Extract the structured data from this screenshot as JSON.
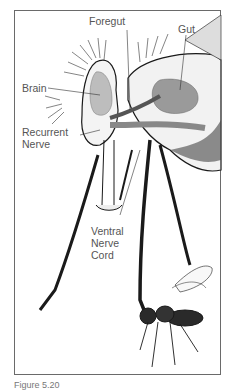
{
  "figure": {
    "labels": {
      "foregut": "Foregut",
      "gut": "Gut",
      "brain": "Brain",
      "recurrent_nerve_1": "Recurrent",
      "recurrent_nerve_2": "Nerve",
      "ventral_1": "Ventral",
      "ventral_2": "Nerve",
      "ventral_3": "Cord"
    },
    "caption": "Figure 5.20",
    "colors": {
      "ink": "#1a1a1a",
      "shade": "#9a9a9a",
      "light_shade": "#bdbdbd",
      "frame": "#6a6a6a"
    }
  }
}
